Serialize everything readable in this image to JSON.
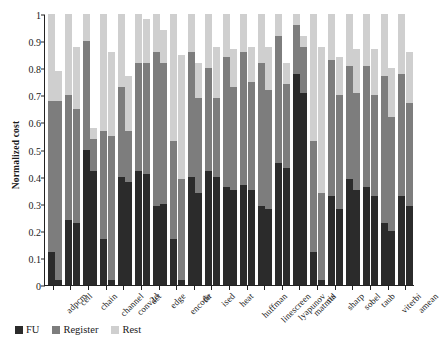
{
  "chart_data": {
    "type": "bar",
    "title": "",
    "subtitle": "",
    "xlabel": "",
    "ylabel": "Normalized cost",
    "stacked": true,
    "grouped_bars_per_category": 2,
    "ylim": [
      0,
      1
    ],
    "grid": false,
    "legend_position": "bottom-left",
    "ytick_labels": [
      "0",
      "0.1",
      "0.2",
      "0.3",
      "0.4",
      "0.5",
      "0.6",
      "0.7",
      "0.8",
      "0.9",
      "1"
    ],
    "ytick_values": [
      0,
      0.1,
      0.2,
      0.3,
      0.4,
      0.5,
      0.6,
      0.7,
      0.8,
      0.9,
      1
    ],
    "categories": [
      "adpcm",
      "cell",
      "chain",
      "channel",
      "conv2d",
      "dct",
      "edge",
      "encode",
      "fir",
      "ised",
      "heat",
      "huffman",
      "linescreen",
      "lyapunov",
      "matmul",
      "ris",
      "sharp",
      "sobel",
      "taub",
      "viterbi",
      "amean"
    ],
    "legend": [
      {
        "name": "FU",
        "color": "#2b2b2b"
      },
      {
        "name": "Register",
        "color": "#7d7d7d"
      },
      {
        "name": "Rest",
        "color": "#cfcfcf"
      }
    ],
    "series": [
      {
        "name": "FU",
        "color": "#2b2b2b",
        "bar_a": [
          0.12,
          0.24,
          0.5,
          0.17,
          0.4,
          0.42,
          0.29,
          0.17,
          0.4,
          0.42,
          0.36,
          0.37,
          0.29,
          0.45,
          0.78,
          0.12,
          0.33,
          0.39,
          0.36,
          0.23,
          0.33
        ],
        "bar_b": [
          0.02,
          0.23,
          0.42,
          0.02,
          0.38,
          0.41,
          0.3,
          0.02,
          0.34,
          0.4,
          0.35,
          0.35,
          0.28,
          0.43,
          0.71,
          0.02,
          0.28,
          0.35,
          0.33,
          0.2,
          0.29
        ]
      },
      {
        "name": "Register",
        "color": "#7d7d7d",
        "bar_a": [
          0.56,
          0.46,
          0.4,
          0.4,
          0.33,
          0.4,
          0.57,
          0.36,
          0.46,
          0.38,
          0.48,
          0.49,
          0.53,
          0.47,
          0.18,
          0.41,
          0.5,
          0.42,
          0.45,
          0.54,
          0.45
        ],
        "bar_b": [
          0.66,
          0.42,
          0.12,
          0.53,
          0.19,
          0.41,
          0.52,
          0.37,
          0.35,
          0.29,
          0.38,
          0.4,
          0.44,
          0.31,
          0.17,
          0.32,
          0.42,
          0.36,
          0.37,
          0.42,
          0.38
        ]
      },
      {
        "name": "Rest",
        "color": "#cfcfcf",
        "bar_a": [
          0.32,
          0.3,
          0.1,
          0.43,
          0.27,
          0.18,
          0.14,
          0.47,
          0.14,
          0.2,
          0.16,
          0.14,
          0.18,
          0.08,
          0.04,
          0.47,
          0.17,
          0.19,
          0.19,
          0.23,
          0.22
        ],
        "bar_b": [
          0.11,
          0.23,
          0.04,
          0.31,
          0.2,
          0.16,
          0.12,
          0.46,
          0.13,
          0.19,
          0.14,
          0.13,
          0.16,
          0.08,
          0.04,
          0.54,
          0.14,
          0.16,
          0.17,
          0.18,
          0.19
        ]
      }
    ],
    "bar_totals": {
      "bar_a": [
        1.0,
        1.0,
        1.0,
        1.0,
        1.0,
        1.0,
        1.0,
        1.0,
        1.0,
        1.0,
        1.0,
        1.0,
        1.0,
        1.0,
        1.0,
        1.0,
        1.0,
        1.0,
        1.0,
        1.0,
        1.0
      ],
      "bar_b": [
        0.79,
        0.88,
        0.58,
        0.86,
        0.77,
        0.98,
        0.94,
        0.85,
        0.82,
        0.88,
        0.87,
        0.88,
        0.88,
        0.82,
        0.92,
        0.88,
        0.84,
        0.87,
        0.87,
        0.8,
        0.86
      ]
    }
  }
}
